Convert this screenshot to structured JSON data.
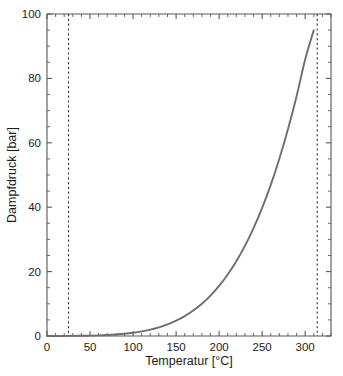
{
  "chart_data": {
    "type": "line",
    "title": "",
    "xlabel": "Temperatur [°C]",
    "ylabel": "Dampfdruck [bar]",
    "xlim": [
      0,
      330
    ],
    "ylim": [
      0,
      100
    ],
    "grid": false,
    "legend": null,
    "xticks": [
      0,
      50,
      100,
      150,
      200,
      250,
      300
    ],
    "xtick_labels": [
      "0",
      "50",
      "100",
      "150",
      "200",
      "250",
      "300"
    ],
    "yticks": [
      0,
      20,
      40,
      60,
      80,
      100
    ],
    "ytick_labels": [
      "0",
      "20",
      "40",
      "60",
      "80",
      "100"
    ],
    "x_minor_tick_step": 10,
    "y_minor_tick_step": 5,
    "series": [
      {
        "name": "Dampfdruckkurve Wasser",
        "color": "#6e6e70",
        "style": "solid",
        "x": [
          0,
          10,
          20,
          25,
          30,
          40,
          50,
          60,
          70,
          80,
          90,
          100,
          110,
          120,
          130,
          140,
          150,
          160,
          170,
          180,
          190,
          200,
          210,
          220,
          230,
          240,
          250,
          260,
          270,
          280,
          290,
          300,
          310
        ],
        "y": [
          0.006,
          0.012,
          0.023,
          0.032,
          0.042,
          0.074,
          0.123,
          0.199,
          0.312,
          0.474,
          0.701,
          1.013,
          1.43,
          1.99,
          2.7,
          3.61,
          4.76,
          6.18,
          7.92,
          10.03,
          12.55,
          15.55,
          19.08,
          23.2,
          27.98,
          33.48,
          39.76,
          46.94,
          55.06,
          64.2,
          74.45,
          85.88,
          95.0
        ]
      }
    ],
    "reference_lines": [
      {
        "name": "untere-markierung",
        "orientation": "vertical",
        "x": 25,
        "style": "dashed",
        "color": "#3a3a3c"
      },
      {
        "name": "obere-markierung",
        "orientation": "vertical",
        "x": 314,
        "style": "dashed",
        "color": "#3a3a3c"
      }
    ]
  },
  "colors": {
    "axis": "#58585a",
    "curve": "#6e6e70",
    "reference": "#3a3a3c",
    "text": "#1c1c1c",
    "background": "#ffffff"
  }
}
